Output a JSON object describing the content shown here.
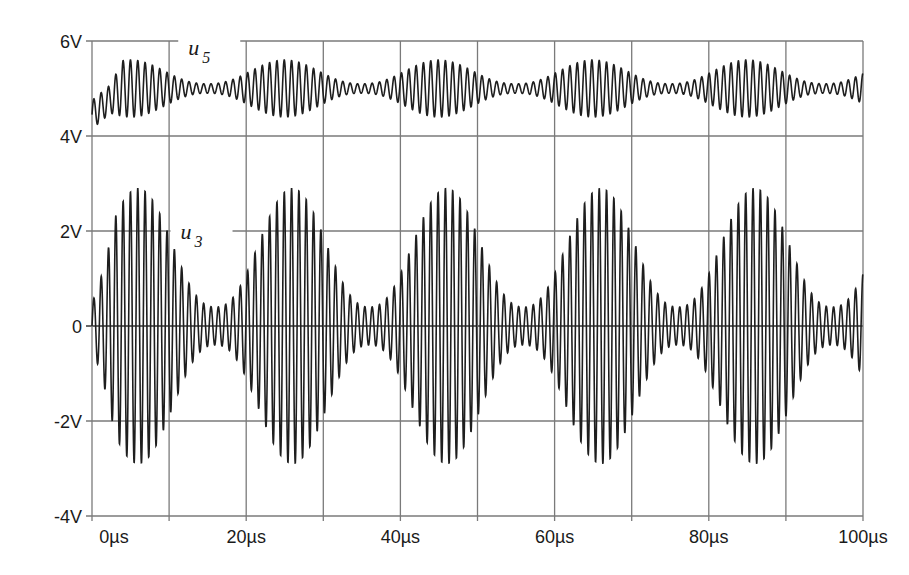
{
  "chart_data": {
    "type": "line",
    "title": "",
    "xlabel": "",
    "ylabel": "",
    "xlim": [
      0,
      100
    ],
    "ylim": [
      -4,
      6
    ],
    "grid": true,
    "legend": "none",
    "x_unit": "µs",
    "y_unit": "V",
    "x_ticks": [
      "0µs",
      "20µs",
      "40µs",
      "60µs",
      "80µs",
      "100µs"
    ],
    "x_tick_values": [
      0,
      20,
      40,
      60,
      80,
      100
    ],
    "x_grid_values": [
      0,
      10,
      20,
      30,
      40,
      50,
      60,
      70,
      80,
      90,
      100
    ],
    "y_ticks": [
      "6V",
      "4V",
      "2V",
      "0",
      "-2V",
      "-4V"
    ],
    "y_tick_values": [
      6,
      4,
      2,
      0,
      -2,
      -4
    ],
    "series": [
      {
        "name": "u5",
        "label_main": "u",
        "label_sub": "5",
        "label_position": {
          "x_us": 13,
          "y_v": 6
        },
        "description": "Oscillation around 5V with beat envelope; carrier ≈1 MHz, envelope period ≈20µs",
        "offset_v": 5.0,
        "carrier_period_us": 0.95,
        "beat_period_us": 20,
        "max_amplitude_v": 0.6,
        "min_amplitude_v": 0.1,
        "envelope_peaks_us": [
          5,
          25,
          45,
          65,
          85
        ],
        "envelope_minima_us": [
          15,
          35,
          55,
          75,
          95
        ],
        "approx_range_v": [
          4.0,
          5.6
        ],
        "start_transient": "dips to ≈4.0V during first 3µs"
      },
      {
        "name": "u3",
        "label_main": "u",
        "label_sub": "3",
        "label_position": {
          "x_us": 12,
          "y_v": 2
        },
        "description": "Amplitude-modulated oscillation around 0V (beating); carrier ≈1 MHz, envelope period ≈20µs",
        "offset_v": 0.0,
        "carrier_period_us": 0.95,
        "beat_period_us": 20,
        "max_amplitude_v": 2.9,
        "min_amplitude_v": 0.4,
        "envelope_peaks_us": [
          6,
          25,
          45,
          65,
          86
        ],
        "envelope_minima_us": [
          15,
          35,
          55,
          75,
          95
        ],
        "peak_values_v": [
          2.85,
          2.95,
          2.9,
          2.85,
          2.85
        ],
        "approx_range_v": [
          -2.95,
          2.95
        ]
      }
    ]
  },
  "colors": {
    "trace": "#1e1e1e",
    "trace_light": "#6a6a6a",
    "grid": "#7a7a7a",
    "axis": "#555555",
    "text": "#1a1a1a",
    "background": "#ffffff"
  }
}
